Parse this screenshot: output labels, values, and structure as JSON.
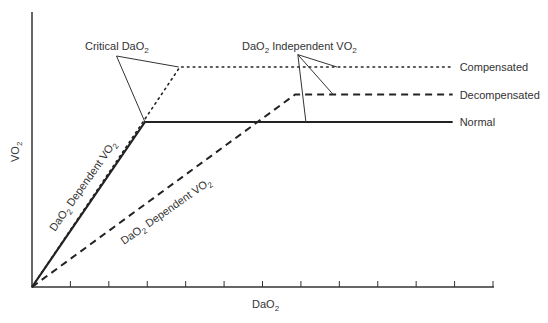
{
  "chart_data": {
    "type": "line",
    "title": "",
    "xlabel": "DaO2",
    "ylabel": "VO2",
    "xlabel_parts": {
      "main": "DaO",
      "sub": "2"
    },
    "ylabel_parts": {
      "main": "VO",
      "sub": "2"
    },
    "xlim": [
      0,
      12
    ],
    "ylim": [
      0,
      100
    ],
    "x_ticks": [
      1,
      2,
      3,
      4,
      5,
      6,
      7,
      8,
      9,
      10,
      11,
      12
    ],
    "tick_labels_shown": false,
    "grid": false,
    "series": [
      {
        "name": "Compensated",
        "style": "dotted",
        "x": [
          0,
          3.85,
          10.95
        ],
        "y": [
          0,
          80,
          80
        ]
      },
      {
        "name": "Decompensated",
        "style": "dashed",
        "x": [
          0,
          6.85,
          10.95
        ],
        "y": [
          0,
          70,
          70
        ]
      },
      {
        "name": "Normal",
        "style": "solid",
        "x": [
          0,
          2.94,
          10.95
        ],
        "y": [
          0,
          60,
          60
        ]
      }
    ],
    "legend_placement": "right (inline line-end labels)",
    "annotations": [
      {
        "id": "critical",
        "text_main": "Critical DaO",
        "text_sub": "2",
        "anchor": [
          2.2,
          84
        ],
        "points_to": [
          [
            2.94,
            60
          ],
          [
            3.82,
            80
          ]
        ]
      },
      {
        "id": "independent",
        "text_pre": "DaO",
        "text_pre_sub": "2",
        "text_main": " Independent VO",
        "text_sub": "2",
        "anchor": [
          6.92,
          84.5
        ],
        "points_to": [
          [
            7.94,
            80
          ],
          [
            7.84,
            70
          ],
          [
            7.13,
            60
          ]
        ]
      },
      {
        "id": "dependent-normal",
        "text_pre": "DaO",
        "text_pre_sub": "2",
        "text_main": " Dependent VO",
        "text_sub": "2",
        "along_series": "Normal"
      },
      {
        "id": "dependent-decompensated",
        "text_pre": "DaO",
        "text_pre_sub": "2",
        "text_main": " Dependent VO",
        "text_sub": "2",
        "along_series": "Decompensated"
      }
    ]
  }
}
